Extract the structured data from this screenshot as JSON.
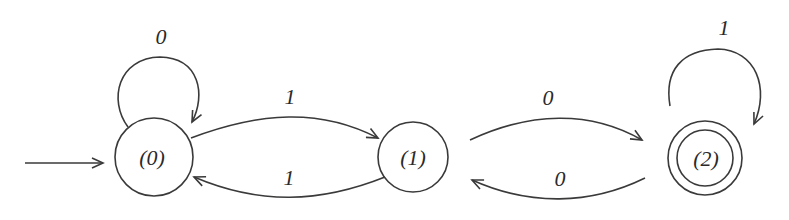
{
  "diagram": {
    "type": "finite-state-automaton",
    "start_state": "(0)",
    "states": [
      {
        "id": "s0",
        "label": "(0)",
        "accepting": false,
        "start": true
      },
      {
        "id": "s1",
        "label": "(1)",
        "accepting": false,
        "start": false
      },
      {
        "id": "s2",
        "label": "(2)",
        "accepting": true,
        "start": false
      }
    ],
    "transitions": [
      {
        "from": "s0",
        "to": "s0",
        "label": "0"
      },
      {
        "from": "s0",
        "to": "s1",
        "label": "1"
      },
      {
        "from": "s1",
        "to": "s0",
        "label": "1"
      },
      {
        "from": "s1",
        "to": "s2",
        "label": "0"
      },
      {
        "from": "s2",
        "to": "s1",
        "label": "0"
      },
      {
        "from": "s2",
        "to": "s2",
        "label": "1"
      }
    ],
    "colors": {
      "stroke": "#3a3a3a",
      "text": "#2a2a2a",
      "background": "#ffffff"
    }
  }
}
